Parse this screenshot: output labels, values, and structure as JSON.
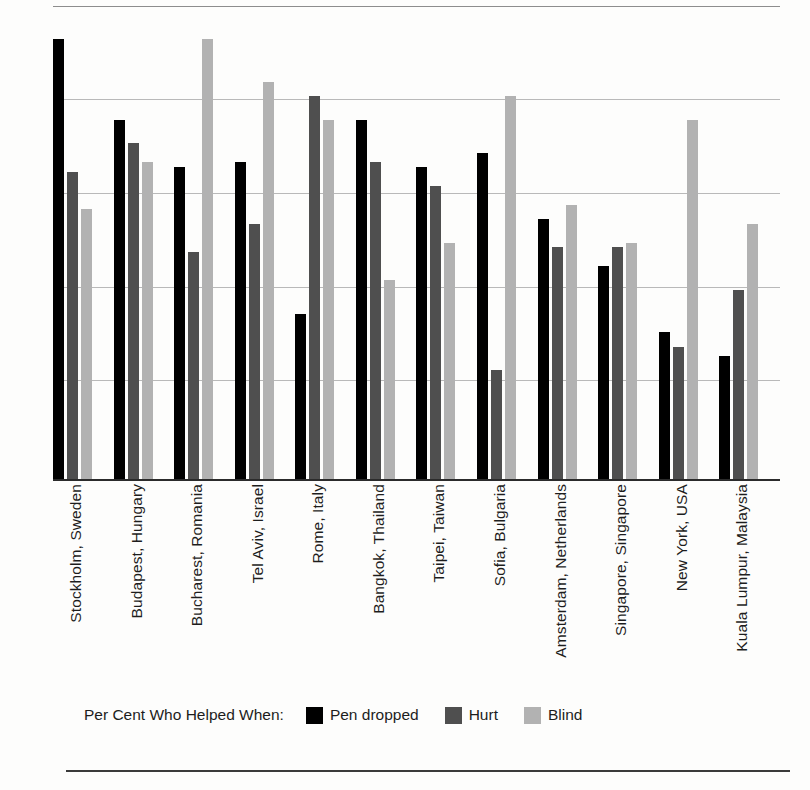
{
  "chart_data": {
    "type": "bar",
    "title": "",
    "subtitle": "",
    "xlabel": "",
    "ylabel": "",
    "ylim": [
      0,
      100
    ],
    "grid": true,
    "gridlines": [
      0,
      20,
      40,
      60,
      80,
      100
    ],
    "legend_position": "bottom",
    "legend_title": "Per Cent Who Helped When:",
    "categories": [
      "Stockholm, Sweden",
      "Budapest, Hungary",
      "Bucharest, Romania",
      "Tel Aviv, Israel",
      "Rome, Italy",
      "Bangkok, Thailand",
      "Taipei, Taiwan",
      "Sofia, Bulgaria",
      "Amsterdam, Netherlands",
      "Singapore, Singapore",
      "New York, USA",
      "Kuala Lumpur, Malaysia"
    ],
    "series": [
      {
        "name": "Pen dropped",
        "color": "#000000",
        "values": [
          93,
          76,
          66,
          67,
          35,
          76,
          66,
          69,
          55,
          45,
          31,
          26
        ]
      },
      {
        "name": "Hurt",
        "color": "#4f4f4f",
        "values": [
          65,
          71,
          48,
          54,
          81,
          67,
          62,
          23,
          49,
          49,
          28,
          40
        ]
      },
      {
        "name": "Blind",
        "color": "#b2b2b2",
        "values": [
          57,
          67,
          93,
          84,
          76,
          42,
          50,
          81,
          58,
          50,
          76,
          54
        ]
      }
    ]
  },
  "legend": {
    "title": "Per Cent Who Helped When:",
    "items": [
      {
        "label": "Pen dropped",
        "color": "#000000"
      },
      {
        "label": "Hurt",
        "color": "#4f4f4f"
      },
      {
        "label": "Blind",
        "color": "#b2b2b2"
      }
    ]
  }
}
